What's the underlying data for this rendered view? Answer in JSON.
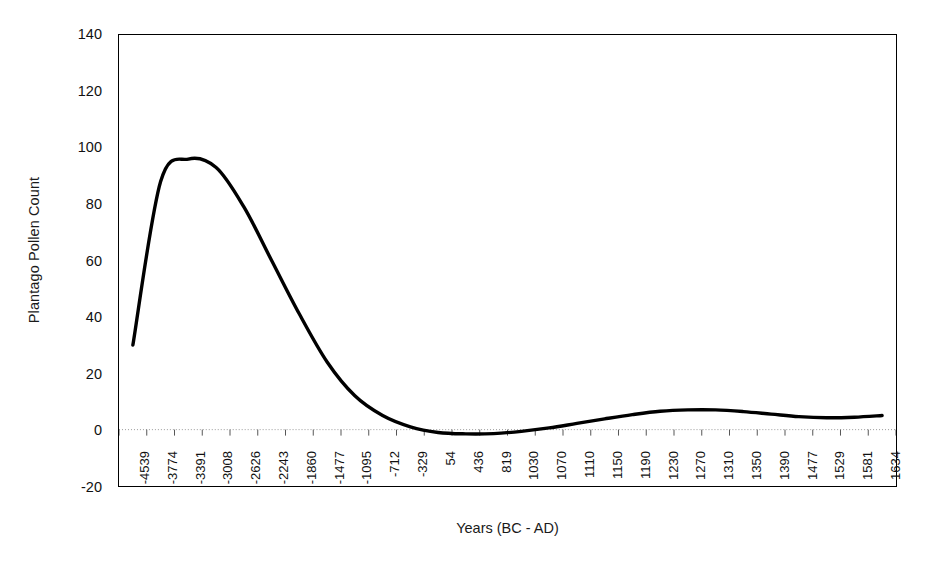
{
  "chart_data": {
    "type": "line",
    "title": "",
    "xlabel": "Years (BC - AD)",
    "ylabel": "Plantago Pollen Count",
    "ylim": [
      -20,
      140
    ],
    "yticks": [
      140,
      120,
      100,
      80,
      60,
      40,
      20,
      0,
      -20
    ],
    "grid": false,
    "zero_line": true,
    "legend": "none",
    "categories": [
      "-4539",
      "-3774",
      "-3391",
      "-3008",
      "-2626",
      "-2243",
      "-1860",
      "-1477",
      "-1095",
      "-712",
      "-329",
      "54",
      "436",
      "819",
      "1030",
      "1070",
      "1110",
      "1150",
      "1190",
      "1230",
      "1270",
      "1310",
      "1350",
      "1390",
      "1477",
      "1529",
      "1581",
      "1634"
    ],
    "series": [
      {
        "name": "Plantago Pollen Count",
        "color": "#000000",
        "values": [
          30,
          88,
          96,
          93,
          79,
          60,
          41,
          24,
          12,
          5,
          1,
          -1,
          -1.5,
          -1.4,
          -0.6,
          0.6,
          2.2,
          3.8,
          5.3,
          6.5,
          7,
          7,
          6.4,
          5.5,
          4.6,
          4.2,
          4.4,
          5
        ]
      }
    ]
  },
  "axes": {
    "y_title": "Plantago Pollen Count",
    "x_title": "Years (BC - AD)"
  },
  "colors": {
    "line": "#000000",
    "frame": "#000000",
    "zero_line": "#9a9a9a",
    "background": "#ffffff"
  }
}
